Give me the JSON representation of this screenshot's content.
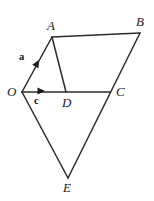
{
  "figure": {
    "background_color": "#ffffff",
    "stroke_color": "#2b2b2b",
    "label_color": "#1a1a1a",
    "width": 154,
    "height": 201
  },
  "vertices": [
    {
      "name": "O",
      "label": "O",
      "x": 22,
      "y": 92,
      "label_x": 7,
      "label_y": 85
    },
    {
      "name": "A",
      "label": "A",
      "x": 52,
      "y": 37,
      "label_x": 47,
      "label_y": 19
    },
    {
      "name": "B",
      "label": "B",
      "x": 140,
      "y": 33,
      "label_x": 136,
      "label_y": 15
    },
    {
      "name": "C",
      "label": "C",
      "x": 110,
      "y": 92,
      "label_x": 116,
      "label_y": 85
    },
    {
      "name": "D",
      "label": "D",
      "x": 66,
      "y": 92,
      "label_x": 62,
      "label_y": 96
    },
    {
      "name": "E",
      "label": "E",
      "x": 68,
      "y": 178,
      "label_x": 63,
      "label_y": 181
    }
  ],
  "edges": [
    {
      "name": "edge-O-A",
      "from": "O",
      "to": "A"
    },
    {
      "name": "edge-A-B",
      "from": "A",
      "to": "B"
    },
    {
      "name": "edge-A-D",
      "from": "A",
      "to": "D"
    },
    {
      "name": "edge-O-C",
      "from": "O",
      "to": "C"
    },
    {
      "name": "edge-B-E",
      "from": "B",
      "to": "E"
    },
    {
      "name": "edge-O-E",
      "from": "O",
      "to": "E"
    }
  ],
  "vectors": [
    {
      "name": "vector-a",
      "label": "a",
      "from": "O",
      "to": "A",
      "arrow_x": 39,
      "arrow_y": 60,
      "angle_deg": -61,
      "label_x": 19,
      "label_y": 52
    },
    {
      "name": "vector-c",
      "label": "c",
      "from": "O",
      "to": "D",
      "arrow_x": 45,
      "arrow_y": 91,
      "angle_deg": 0,
      "label_x": 34,
      "label_y": 96
    }
  ]
}
